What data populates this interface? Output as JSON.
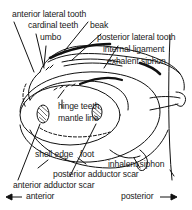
{
  "diagram": {
    "labels": {
      "anterior_lateral_tooth": "anterior lateral tooth",
      "cardinal_teeth": "cardinal teeth",
      "beak": "beak",
      "umbo": "umbo",
      "posterior_lateral_tooth": "posterior lateral tooth",
      "internal_ligament": "internal ligament",
      "exhalent_siphon": "exhalent siphon",
      "hinge_teeth": "hinge teeth",
      "mantle_line": "mantle line",
      "shell_edge": "shell edge",
      "foot": "foot",
      "inhalent_siphon": "inhalent siphon",
      "posterior_adductor_scar": "posterior adductor scar",
      "anterior_adductor_scar": "anterior adductor scar"
    },
    "orientation": {
      "anterior": "anterior",
      "posterior": "posterior",
      "anterior_arrow": "left-arrow-icon",
      "posterior_arrow": "right-arrow-icon"
    },
    "colors": {
      "line": "#111111",
      "background": "#ffffff"
    }
  }
}
